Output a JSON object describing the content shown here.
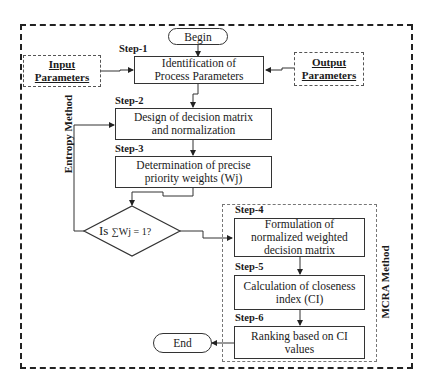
{
  "flowchart": {
    "begin": "Begin",
    "end": "End",
    "input_parameters": {
      "line1": "Input",
      "line2": "Parameters"
    },
    "output_parameters": {
      "line1": "Output",
      "line2": "Parameters"
    },
    "steps": [
      {
        "label": "Step-1",
        "text": "Identification of Process Parameters"
      },
      {
        "label": "Step-2",
        "text": "Design of decision matrix and normalization"
      },
      {
        "label": "Step-3",
        "text": "Determination of precise priority weights (Wj)"
      },
      {
        "label": "Step-4",
        "text": "Formulation of normalized weighted decision matrix"
      },
      {
        "label": "Step-5",
        "text": "Calculation of closeness index (CI)"
      },
      {
        "label": "Step-6",
        "text": "Ranking based on CI values"
      }
    ],
    "decision": {
      "prefix": "Is",
      "condition": "∑Wj = 1?"
    },
    "groups": {
      "entropy": "Entropy Method",
      "mcra": "MCRA Method"
    }
  }
}
